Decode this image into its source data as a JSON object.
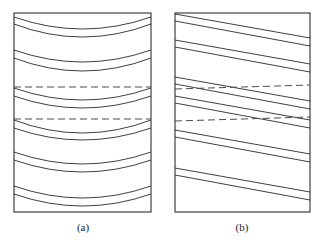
{
  "figure": {
    "background_color": "#ffffff",
    "line_color": "#2a2a2a",
    "frame_color": "#1a1a1a",
    "dashed_color": "#4a4a4a",
    "panels": [
      {
        "id": "panel-a",
        "caption": "(a)",
        "caption_x": 83,
        "caption_y": 231,
        "frame": {
          "x": 14,
          "y": 13,
          "width": 137,
          "height": 199
        },
        "line_style": "curved",
        "description": "curved concave-up contour bands spanning the panel width",
        "dashed_reference_lines": [
          {
            "y_left": 87,
            "y_right": 87
          },
          {
            "y_left": 119,
            "y_right": 119
          }
        ],
        "contours": [
          {
            "edge_y": 17,
            "mid_y": 29
          },
          {
            "edge_y": 24,
            "mid_y": 37
          },
          {
            "edge_y": 50,
            "mid_y": 62
          },
          {
            "edge_y": 58,
            "mid_y": 71
          },
          {
            "edge_y": 88,
            "mid_y": 100
          },
          {
            "edge_y": 96,
            "mid_y": 108
          },
          {
            "edge_y": 120,
            "mid_y": 133
          },
          {
            "edge_y": 128,
            "mid_y": 140
          },
          {
            "edge_y": 152,
            "mid_y": 164
          },
          {
            "edge_y": 160,
            "mid_y": 172
          },
          {
            "edge_y": 186,
            "mid_y": 198
          },
          {
            "edge_y": 194,
            "mid_y": 206
          }
        ]
      },
      {
        "id": "panel-b",
        "caption": "(b)",
        "caption_x": 242,
        "caption_y": 231,
        "frame": {
          "x": 175,
          "y": 13,
          "width": 135,
          "height": 199
        },
        "line_style": "straight-diagonal",
        "description": "straight parallel lines sloping down from left to right",
        "dashed_reference_lines": [
          {
            "y_left": 89,
            "y_right": 85
          },
          {
            "y_left": 121,
            "y_right": 117
          }
        ],
        "contours": [
          {
            "left_y": 14,
            "right_y": 38
          },
          {
            "left_y": 21,
            "right_y": 46
          },
          {
            "left_y": 40,
            "right_y": 64
          },
          {
            "left_y": 47,
            "right_y": 72
          },
          {
            "left_y": 77,
            "right_y": 101
          },
          {
            "left_y": 84,
            "right_y": 109
          },
          {
            "left_y": 96,
            "right_y": 120
          },
          {
            "left_y": 103,
            "right_y": 128
          },
          {
            "left_y": 130,
            "right_y": 154
          },
          {
            "left_y": 137,
            "right_y": 162
          },
          {
            "left_y": 168,
            "right_y": 192
          },
          {
            "left_y": 175,
            "right_y": 200
          }
        ]
      }
    ]
  }
}
